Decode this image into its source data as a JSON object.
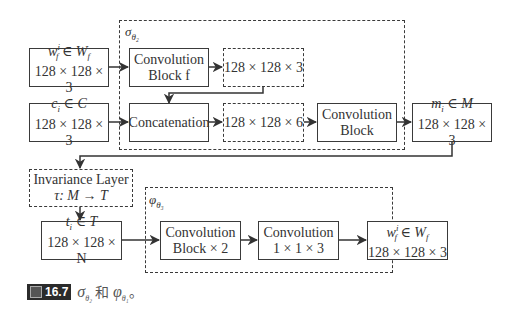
{
  "groups": {
    "sigma": {
      "label": "σ",
      "sub": "θ₂"
    },
    "phi": {
      "label": "φ",
      "sub": "θ₃"
    }
  },
  "boxes": {
    "wf_in": {
      "line1": "wᶠⁱ ∈ W_f",
      "l1a": "w",
      "l1sup": "i",
      "l1sub": "f",
      "l1b": " ∈ W",
      "l1bsub": "f",
      "line2": "128 × 128 × 3"
    },
    "ci": {
      "line1a": "c",
      "line1sub": "i",
      "line1b": " ∈ C",
      "line2": "128 × 128 × 3"
    },
    "conv_f": {
      "line1": "Convolution",
      "line2": "Block f"
    },
    "feat3": {
      "line1": "128 × 128 × 3"
    },
    "concat": {
      "line1": "Concatenation"
    },
    "feat6": {
      "line1": "128 × 128 × 6"
    },
    "conv_block": {
      "line1": "Convolution",
      "line2": "Block"
    },
    "mi": {
      "line1a": "m",
      "line1sub": "i",
      "line1b": " ∈ M",
      "line2": "128 × 128 × 3"
    },
    "invariance": {
      "line1": "Invariance Layer",
      "line2": "τ: M → T"
    },
    "ti": {
      "line1a": "t",
      "line1sub": "i",
      "line1b": " ∈ T",
      "line2": "128 × 128 × N"
    },
    "conv_x2": {
      "line1": "Convolution",
      "line2": "Block × 2"
    },
    "conv_113": {
      "line1": "Convolution",
      "line2": "1 × 1 × 3"
    },
    "wf_out": {
      "l1a": "w",
      "l1sup": "i",
      "l1sub": "f",
      "l1b": " ∈ W",
      "l1bsub": "f",
      "line2": "128 × 128 × 3"
    }
  },
  "caption": {
    "figure_label": "16.7",
    "text_sigma": "σ",
    "text_sigma_sub": "θ₂",
    "text_and": " 和 ",
    "text_phi": "φ",
    "text_phi_sub": "θ₁",
    "text_end": "。"
  }
}
